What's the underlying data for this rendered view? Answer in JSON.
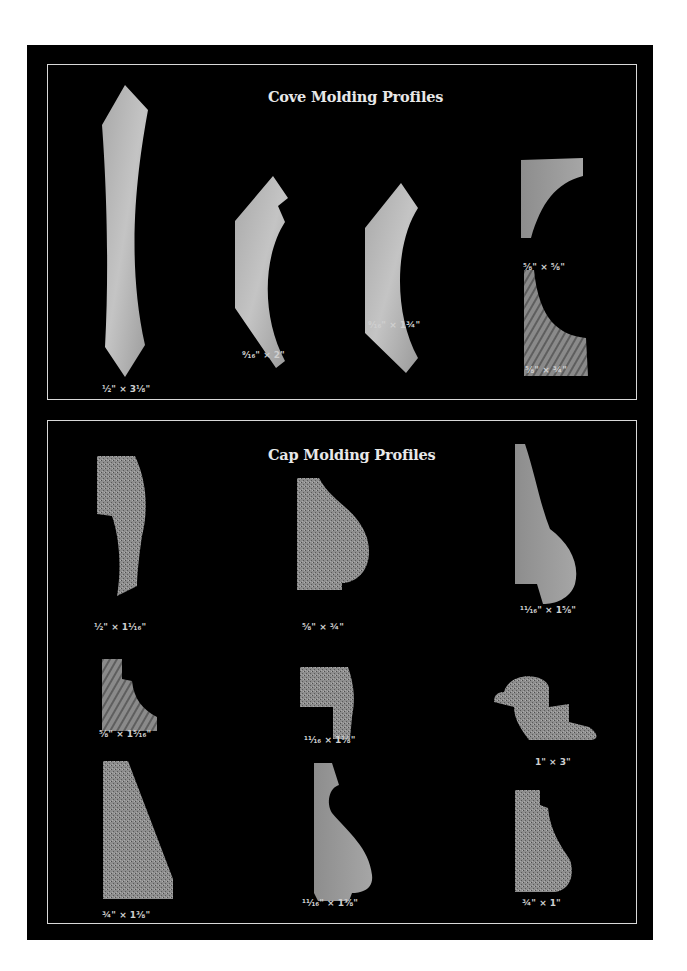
{
  "cove": {
    "title": "Cove Molding Profiles",
    "profiles": [
      {
        "label": "½\" × 3⅛\""
      },
      {
        "label": "⁹⁄₁₆\" × 2\""
      },
      {
        "label": "⁹⁄₁₆\" × 1¾\""
      },
      {
        "label": "⅝\" × ⅝\""
      },
      {
        "label": "⅝\" × ¾\""
      }
    ]
  },
  "cap": {
    "title": "Cap Molding Profiles",
    "profiles": [
      {
        "label": "½\" × 1¹⁄₁₆\""
      },
      {
        "label": "⅝\" × ¾\""
      },
      {
        "label": "¹¹⁄₁₆\" × 1⅝\""
      },
      {
        "label": "⅝\" × 1⁵⁄₁₆\""
      },
      {
        "label": "¹¹⁄₁₆ × 1⅛\""
      },
      {
        "label": "1\" × 3\""
      },
      {
        "label": "¾\" × 1⅜\""
      },
      {
        "label": "¹¹⁄₁₆\" × 1⅜\""
      },
      {
        "label": "¾\" × 1\""
      }
    ]
  },
  "colors": {
    "background": "#000000",
    "border": "#d8d8d8",
    "wood_light": "#b4b4b4",
    "wood_dark": "#7a7a7a"
  }
}
